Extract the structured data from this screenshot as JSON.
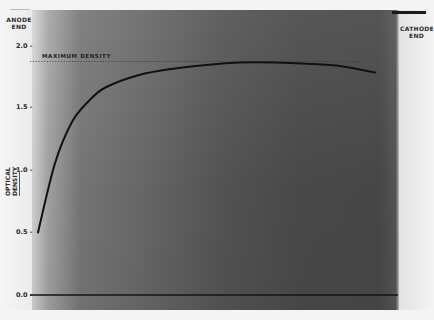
{
  "labels": {
    "anode": "ANODE END",
    "anode_line1": "ANODE",
    "anode_line2": "END",
    "cathode_line1": "CATHODE",
    "cathode_line2": "END",
    "ylabel_line1": "OPTICAL",
    "ylabel_line2": "DENSITY",
    "max_density": "MAXIMUM  DENSITY"
  },
  "ticks": [
    {
      "label": "2.0 -",
      "value": 2.0
    },
    {
      "label": "1.5 -",
      "value": 1.5
    },
    {
      "label": "1.0 -",
      "value": 1.0
    },
    {
      "label": "0.5 -",
      "value": 0.5
    },
    {
      "label": "0.0 -",
      "value": 0.0
    }
  ],
  "colors": {
    "curve": "#111111",
    "film_dark": "#4a4a4a",
    "margin": "#f4f4f4"
  },
  "chart_data": {
    "type": "line",
    "title": "",
    "xlabel": "Position along film (anode end to cathode end)",
    "ylabel": "OPTICAL DENSITY",
    "x_left_label": "ANODE END",
    "x_right_label": "CATHODE END",
    "ylim": [
      0,
      2.0
    ],
    "yticks": [
      0.0,
      0.5,
      1.0,
      1.5,
      2.0
    ],
    "grid": false,
    "legend": null,
    "annotations": [
      {
        "text": "MAXIMUM DENSITY",
        "type": "dotted-hline",
        "y": 1.86
      }
    ],
    "series": [
      {
        "name": "Optical density profile",
        "x": [
          0,
          5,
          10,
          15,
          20,
          30,
          40,
          50,
          60,
          70,
          80,
          90,
          100
        ],
        "values": [
          0.5,
          1.05,
          1.38,
          1.55,
          1.66,
          1.76,
          1.81,
          1.84,
          1.86,
          1.86,
          1.85,
          1.83,
          1.78
        ]
      },
      {
        "name": "Baseline",
        "x": [
          0,
          100
        ],
        "values": [
          0.0,
          0.0
        ]
      }
    ]
  }
}
